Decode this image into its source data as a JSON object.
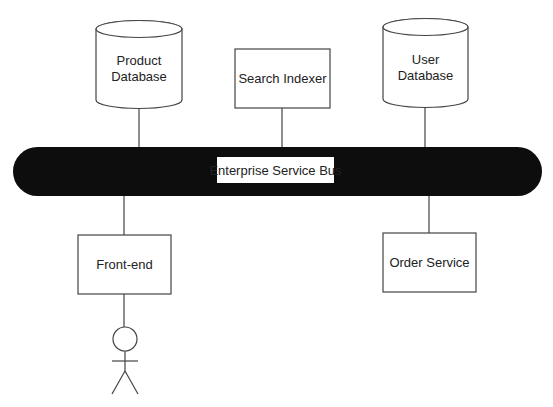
{
  "diagram": {
    "colors": {
      "background": "#ffffff",
      "bus_fill": "#0d0d0d",
      "stroke": "#444444",
      "text": "#222222",
      "label_bg": "#ffffff"
    },
    "bus": {
      "label": "Enterprise Service Bus"
    },
    "nodes": {
      "product_db": {
        "type": "database",
        "line1": "Product",
        "line2": "Database"
      },
      "search_indexer": {
        "type": "service",
        "label": "Search Indexer"
      },
      "user_db": {
        "type": "database",
        "line1": "User",
        "line2": "Database"
      },
      "front_end": {
        "type": "service",
        "label": "Front-end"
      },
      "order_service": {
        "type": "service",
        "label": "Order Service"
      },
      "user_actor": {
        "type": "actor"
      }
    },
    "connections": [
      {
        "from": "product_db",
        "to": "bus"
      },
      {
        "from": "search_indexer",
        "to": "bus"
      },
      {
        "from": "user_db",
        "to": "bus"
      },
      {
        "from": "bus",
        "to": "front_end"
      },
      {
        "from": "bus",
        "to": "order_service"
      },
      {
        "from": "front_end",
        "to": "user_actor"
      }
    ]
  }
}
